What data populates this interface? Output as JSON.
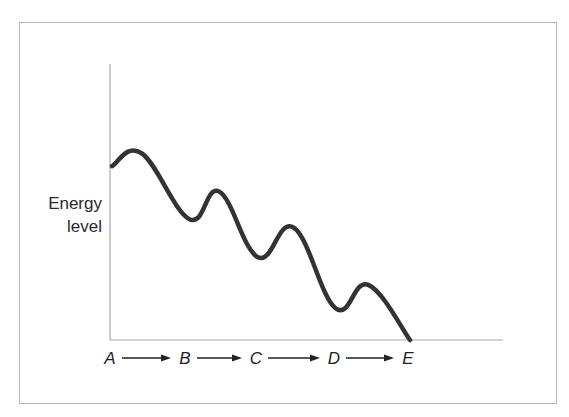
{
  "diagram": {
    "y_axis_label_lines": [
      "Energy",
      "level"
    ],
    "x_stages": [
      "A",
      "B",
      "C",
      "D",
      "E"
    ],
    "arrow_count": 4,
    "curve_color": "#333333",
    "axis_color": "#a8a8a8",
    "frame_color": "#b8b8b8"
  },
  "chart_data": {
    "type": "line",
    "title": "",
    "xlabel": "",
    "ylabel": "Energy level",
    "categories": [
      "A",
      "B",
      "C",
      "D",
      "E"
    ],
    "points": [
      {
        "x": 0.0,
        "y": 0.82
      },
      {
        "x": 0.1,
        "y": 0.88
      },
      {
        "x": 0.26,
        "y": 0.57
      },
      {
        "x": 0.36,
        "y": 0.7
      },
      {
        "x": 0.49,
        "y": 0.39
      },
      {
        "x": 0.61,
        "y": 0.53
      },
      {
        "x": 0.75,
        "y": 0.15
      },
      {
        "x": 0.86,
        "y": 0.26
      },
      {
        "x": 1.0,
        "y": 0.0
      }
    ],
    "xlim": [
      0,
      1
    ],
    "ylim": [
      0,
      1
    ],
    "grid": false,
    "legend": "none"
  }
}
